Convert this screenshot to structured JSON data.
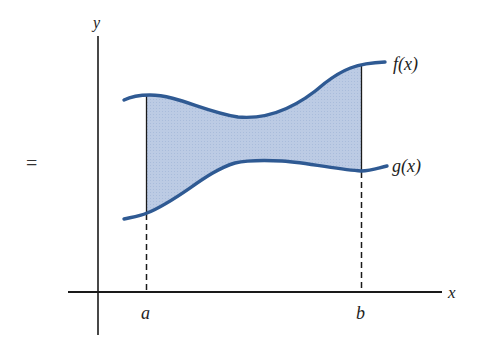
{
  "figure": {
    "prefix_symbol": "=",
    "axes": {
      "x_label": "x",
      "y_label": "y"
    },
    "bounds": {
      "a_label": "a",
      "b_label": "b"
    },
    "curves": [
      {
        "name": "upper",
        "label": "f(x)"
      },
      {
        "name": "lower",
        "label": "g(x)"
      }
    ],
    "colors": {
      "curve": "#2f5a93",
      "fill": "#b9c9e3",
      "axis": "#1a1a1a"
    }
  }
}
